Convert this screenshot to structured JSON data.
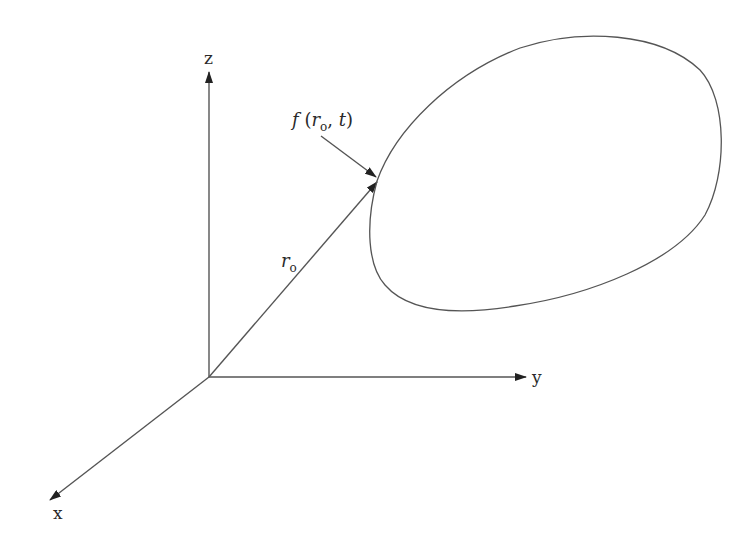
{
  "diagram": {
    "line_color": "#555555",
    "arrow_color": "#222222",
    "axes": {
      "z": {
        "label": "z"
      },
      "y": {
        "label": "y"
      },
      "x": {
        "label": "x"
      }
    },
    "vector": {
      "label_main": "r",
      "label_sub": "o"
    },
    "point_label": {
      "func": "f",
      "open": " (",
      "arg1_main": "r",
      "arg1_sub": "o",
      "sep": ", ",
      "arg2": "t",
      "close": ")"
    }
  }
}
